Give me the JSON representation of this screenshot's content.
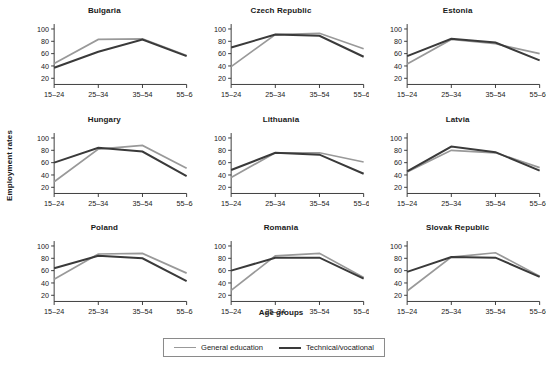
{
  "chart_data": {
    "type": "line",
    "title": "",
    "xlabel": "Age groups",
    "ylabel": "Employment rates",
    "categories": [
      "15–24",
      "25–34",
      "35–54",
      "55–64"
    ],
    "ylim": [
      10,
      108
    ],
    "yticks": [
      20,
      40,
      60,
      80,
      100
    ],
    "grid": false,
    "legend_position": "bottom",
    "colors": {
      "general_education": "#999999",
      "technical_vocational": "#3a3a3a",
      "axis": "#2b2b2b",
      "text": "#1a1a1a",
      "background": "#ffffff",
      "legend_border": "#8a8a8a"
    },
    "series_names": [
      "General education",
      "Technical/vocational"
    ],
    "panels": [
      {
        "title": "Bulgaria",
        "series": [
          {
            "name": "General education",
            "values": [
              44,
              83,
              84,
              57
            ]
          },
          {
            "name": "Technical/vocational",
            "values": [
              37,
              63,
              83,
              56
            ]
          }
        ]
      },
      {
        "title": "Czech Republic",
        "series": [
          {
            "name": "General education",
            "values": [
              39,
              91,
              93,
              68
            ]
          },
          {
            "name": "Technical/vocational",
            "values": [
              70,
              91,
              89,
              55
            ]
          }
        ]
      },
      {
        "title": "Estonia",
        "series": [
          {
            "name": "General education",
            "values": [
              43,
              83,
              76,
              60
            ]
          },
          {
            "name": "Technical/vocational",
            "values": [
              56,
              84,
              78,
              49
            ]
          }
        ]
      },
      {
        "title": "Hungary",
        "series": [
          {
            "name": "General education",
            "values": [
              29,
              82,
              88,
              51
            ]
          },
          {
            "name": "Technical/vocational",
            "values": [
              60,
              84,
              78,
              38
            ]
          }
        ]
      },
      {
        "title": "Lithuania",
        "series": [
          {
            "name": "General education",
            "values": [
              36,
              76,
              76,
              61
            ]
          },
          {
            "name": "Technical/vocational",
            "values": [
              48,
              76,
              73,
              42
            ]
          }
        ]
      },
      {
        "title": "Latvia",
        "series": [
          {
            "name": "General education",
            "values": [
              45,
              80,
              76,
              52
            ]
          },
          {
            "name": "Technical/vocational",
            "values": [
              46,
              86,
              77,
              47
            ]
          }
        ]
      },
      {
        "title": "Poland",
        "series": [
          {
            "name": "General education",
            "values": [
              46,
              87,
              88,
              56
            ]
          },
          {
            "name": "Technical/vocational",
            "values": [
              64,
              84,
              80,
              43
            ]
          }
        ]
      },
      {
        "title": "Romania",
        "series": [
          {
            "name": "General education",
            "values": [
              28,
              84,
              88,
              49
            ]
          },
          {
            "name": "Technical/vocational",
            "values": [
              60,
              81,
              81,
              47
            ]
          }
        ]
      },
      {
        "title": "Slovak Republic",
        "series": [
          {
            "name": "General education",
            "values": [
              27,
              82,
              89,
              51
            ]
          },
          {
            "name": "Technical/vocational",
            "values": [
              58,
              82,
              81,
              50
            ]
          }
        ]
      }
    ]
  },
  "legend": {
    "items": [
      {
        "label": "General education",
        "color": "#999999"
      },
      {
        "label": "Technical/vocational",
        "color": "#3a3a3a"
      }
    ]
  },
  "axes": {
    "ylabel": "Employment rates",
    "xlabel": "Age groups"
  }
}
